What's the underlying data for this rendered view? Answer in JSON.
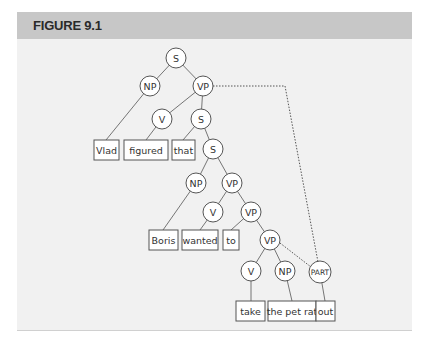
{
  "figure": {
    "title": "FIGURE 9.1"
  },
  "tree": {
    "nodes": [
      {
        "id": "S1",
        "label": "S"
      },
      {
        "id": "NP1",
        "label": "NP"
      },
      {
        "id": "VP1",
        "label": "VP"
      },
      {
        "id": "V1",
        "label": "V"
      },
      {
        "id": "S2",
        "label": "S"
      },
      {
        "id": "S3",
        "label": "S"
      },
      {
        "id": "NP2",
        "label": "NP"
      },
      {
        "id": "VP2",
        "label": "VP"
      },
      {
        "id": "V2",
        "label": "V"
      },
      {
        "id": "VP3",
        "label": "VP"
      },
      {
        "id": "VP4",
        "label": "VP"
      },
      {
        "id": "V3",
        "label": "V"
      },
      {
        "id": "NP3",
        "label": "NP"
      },
      {
        "id": "PART",
        "label": "PART"
      }
    ],
    "leaves": [
      {
        "id": "w1",
        "label": "Vlad"
      },
      {
        "id": "w2",
        "label": "figured"
      },
      {
        "id": "w3",
        "label": "that"
      },
      {
        "id": "w4",
        "label": "Boris"
      },
      {
        "id": "w5",
        "label": "wanted"
      },
      {
        "id": "w6",
        "label": "to"
      },
      {
        "id": "w7",
        "label": "take"
      },
      {
        "id": "w8",
        "label": "the pet rat"
      },
      {
        "id": "w9",
        "label": "out"
      }
    ],
    "dotted_links": [
      {
        "from": "VP1",
        "to": "PART"
      },
      {
        "from": "VP4",
        "to": "PART"
      }
    ]
  }
}
